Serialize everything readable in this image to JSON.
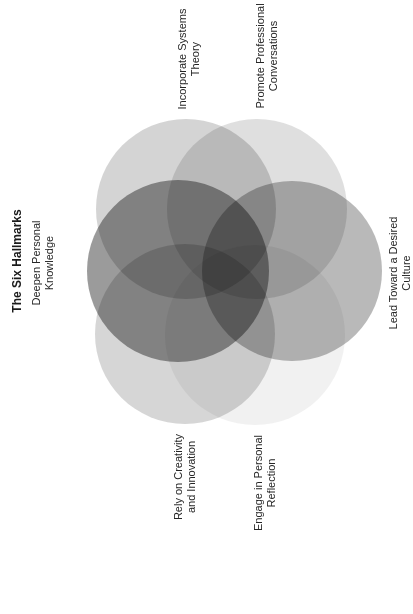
{
  "title": "The Six Hallmarks",
  "orientation": "rotated -90deg (text reads bottom-to-top)",
  "hallmarks": [
    {
      "id": "deepen",
      "line1": "Deepen Personal",
      "line2": "Knowledge",
      "fill": "#8a8a8a"
    },
    {
      "id": "systems",
      "line1": "Incorporate Systems",
      "line2": "Theory",
      "fill": "#cdcdcd"
    },
    {
      "id": "conversations",
      "line1": "Promote Professional",
      "line2": "Conversations",
      "fill": "#d9d9d9"
    },
    {
      "id": "culture",
      "line1": "Lead Toward a Desired",
      "line2": "Culture",
      "fill": "#a8a8a8"
    },
    {
      "id": "reflection",
      "line1": "Engage in Personal",
      "line2": "Reflection",
      "fill": "#f0f0f0"
    },
    {
      "id": "creativity",
      "line1": "Rely on Creativity",
      "line2": "and Innovation",
      "fill": "#cfcfcf"
    }
  ]
}
